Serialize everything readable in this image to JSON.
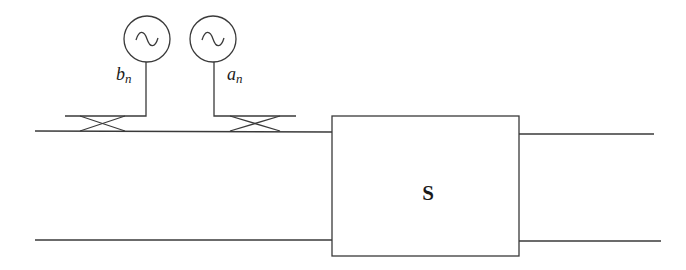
{
  "diagram": {
    "type": "network-analyzer-measurement-setup",
    "sources": [
      {
        "id": "source-b",
        "icon": "ac-source-icon",
        "label": "b",
        "subscript": "n"
      },
      {
        "id": "source-a",
        "icon": "ac-source-icon",
        "label": "a",
        "subscript": "n"
      }
    ],
    "couplers": [
      {
        "id": "coupler-left",
        "icon": "directional-coupler-icon"
      },
      {
        "id": "coupler-right",
        "icon": "directional-coupler-icon"
      }
    ],
    "block": {
      "label": "S"
    },
    "colors": {
      "stroke": "#3a3a3a",
      "background": "#ffffff",
      "text": "#1a1a1a"
    }
  }
}
